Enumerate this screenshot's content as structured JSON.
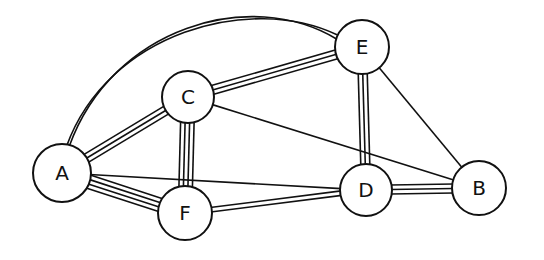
{
  "graph": {
    "stroke_color": "#111111",
    "background": "#ffffff",
    "nodes": [
      {
        "id": "A",
        "label": "A",
        "x": 62,
        "y": 173,
        "r": 29
      },
      {
        "id": "C",
        "label": "C",
        "x": 188,
        "y": 97,
        "r": 26
      },
      {
        "id": "E",
        "label": "E",
        "x": 362,
        "y": 47,
        "r": 27
      },
      {
        "id": "F",
        "label": "F",
        "x": 185,
        "y": 213,
        "r": 27
      },
      {
        "id": "D",
        "label": "D",
        "x": 366,
        "y": 190,
        "r": 26
      },
      {
        "id": "B",
        "label": "B",
        "x": 479,
        "y": 188,
        "r": 27
      }
    ],
    "edges": [
      {
        "from": "A",
        "to": "E",
        "lines": 2,
        "curved": true
      },
      {
        "from": "A",
        "to": "C",
        "lines": 3
      },
      {
        "from": "A",
        "to": "F",
        "lines": 4
      },
      {
        "from": "A",
        "to": "D",
        "lines": 1
      },
      {
        "from": "C",
        "to": "E",
        "lines": 3
      },
      {
        "from": "C",
        "to": "F",
        "lines": 4
      },
      {
        "from": "C",
        "to": "B",
        "lines": 1
      },
      {
        "from": "E",
        "to": "D",
        "lines": 3
      },
      {
        "from": "E",
        "to": "B",
        "lines": 1
      },
      {
        "from": "F",
        "to": "D",
        "lines": 2
      },
      {
        "from": "D",
        "to": "B",
        "lines": 3
      }
    ]
  }
}
